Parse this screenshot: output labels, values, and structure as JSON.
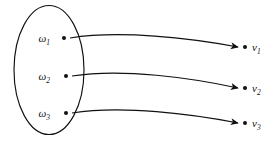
{
  "diagram": {
    "colors": {
      "stroke": "#111111",
      "background": "#ffffff"
    },
    "domain_set": {
      "shape": "ellipse",
      "center_x": 49,
      "center_y": 70,
      "radius_x": 35,
      "radius_y": 64.5,
      "elements": [
        {
          "name": "omega-1",
          "symbol": "ω",
          "subscript": "1",
          "label_x": 50,
          "label_y": 42,
          "dot_x": 64,
          "dot_y": 38
        },
        {
          "name": "omega-2",
          "symbol": "ω",
          "subscript": "2",
          "label_x": 50,
          "label_y": 80,
          "dot_x": 66,
          "dot_y": 76
        },
        {
          "name": "omega-3",
          "symbol": "ω",
          "subscript": "3",
          "label_x": 50,
          "label_y": 117,
          "dot_x": 66,
          "dot_y": 113
        }
      ]
    },
    "codomain_set": {
      "elements": [
        {
          "name": "nu-1",
          "symbol": "ν",
          "subscript": "1",
          "label_x": 252,
          "label_y": 51,
          "dot_x": 245,
          "dot_y": 47
        },
        {
          "name": "nu-2",
          "symbol": "ν",
          "subscript": "2",
          "label_x": 252,
          "label_y": 92,
          "dot_x": 245,
          "dot_y": 88
        },
        {
          "name": "nu-3",
          "symbol": "ν",
          "subscript": "3",
          "label_x": 252,
          "label_y": 127,
          "dot_x": 245,
          "dot_y": 123
        }
      ]
    },
    "arrows": [
      {
        "name": "arrow-omega1-to-nu1",
        "path": "M 70 38 C 120 30, 190 38, 238 47"
      },
      {
        "name": "arrow-omega2-to-nu2",
        "path": "M 72 76 C 122 68, 192 78, 238 88"
      },
      {
        "name": "arrow-omega3-to-nu3",
        "path": "M 72 113 C 122 105, 192 114, 238 123"
      }
    ]
  }
}
